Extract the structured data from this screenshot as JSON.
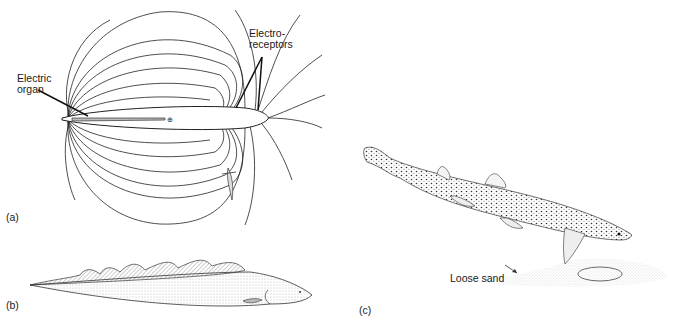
{
  "figure": {
    "panels": [
      {
        "id": "a",
        "label": "(a)",
        "subject": "weakly electric fish with electric field lines",
        "annotations": {
          "electric_organ": "Electric\norgan",
          "electric_organ_line1": "Electric",
          "electric_organ_line2": "organ",
          "electroreceptors_line1": "Electro-",
          "electroreceptors_line2": "receptors"
        },
        "symbols": {
          "positive_pole": "⊕"
        }
      },
      {
        "id": "b",
        "label": "(b)",
        "subject": "knifefish / eel-like fish with undulating dorsal fin"
      },
      {
        "id": "c",
        "label": "(c)",
        "subject": "spotted dogfish shark above flatfish buried in sand",
        "annotations": {
          "loose_sand": "Loose sand"
        }
      }
    ],
    "colors": {
      "ink": "#1a1a1a",
      "background": "#ffffff",
      "stipple": "#555555"
    }
  }
}
